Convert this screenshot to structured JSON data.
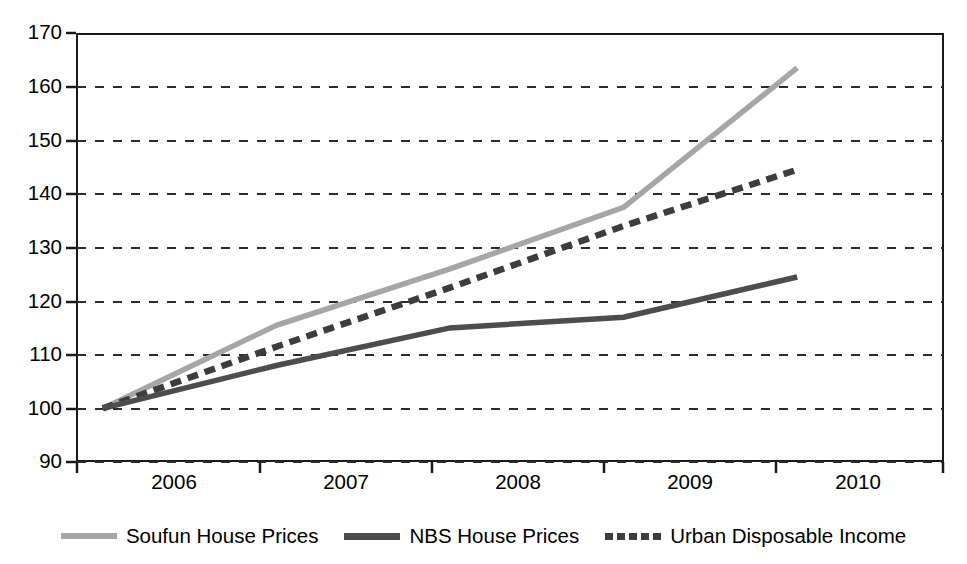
{
  "chart_data": {
    "type": "line",
    "title": "",
    "subtitle": "",
    "xlabel": "",
    "ylabel": "",
    "categories": [
      "2006",
      "2007",
      "2008",
      "2009",
      "2010"
    ],
    "x": [
      2006,
      2007,
      2008,
      2009,
      2010
    ],
    "ylim": [
      90,
      170
    ],
    "yticks": [
      90,
      100,
      110,
      120,
      130,
      140,
      150,
      160,
      170
    ],
    "ytick_labels": [
      "90",
      "100",
      "110",
      "120",
      "130",
      "140",
      "150",
      "160",
      "170"
    ],
    "grid": "horizontal-dashed",
    "legend_position": "bottom-center",
    "series": [
      {
        "name": "Soufun House Prices",
        "values": [
          100,
          115.5,
          126,
          137.5,
          163.5
        ],
        "color": "#a6a6a6",
        "style": "solid",
        "width": 5
      },
      {
        "name": "NBS House Prices",
        "values": [
          100,
          108,
          115,
          117,
          124.5
        ],
        "color": "#4d4d4d",
        "style": "solid",
        "width": 5
      },
      {
        "name": "Urban Disposable Income",
        "values": [
          100,
          111.5,
          122.5,
          134,
          144.5
        ],
        "color": "#3d3d3d",
        "style": "dashed",
        "width": 6
      }
    ]
  },
  "axes": {
    "y_tick_labels": [
      "170",
      "160",
      "150",
      "140",
      "130",
      "120",
      "110",
      "100",
      "90"
    ],
    "x_tick_labels": [
      "2006",
      "2007",
      "2008",
      "2009",
      "2010"
    ]
  },
  "legend": {
    "entries": [
      {
        "label": "Soufun House Prices",
        "swatch": "solid-light-line-swatch"
      },
      {
        "label": "NBS House Prices",
        "swatch": "solid-dark-line-swatch"
      },
      {
        "label": "Urban Disposable Income",
        "swatch": "dashed-dark-line-swatch"
      }
    ]
  },
  "colors": {
    "soufun": "#a6a6a6",
    "nbs": "#4d4d4d",
    "urban_disposable_income": "#3d3d3d",
    "axis": "#1a1a1a",
    "gridline": "#2b2b2b",
    "background": "#ffffff"
  }
}
